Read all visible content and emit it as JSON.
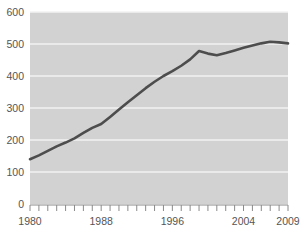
{
  "chart_data": {
    "type": "line",
    "title": "",
    "subtitle": "",
    "xlabel": "",
    "ylabel": "",
    "xlim": [
      1980,
      2009
    ],
    "ylim": [
      0,
      600
    ],
    "grid": true,
    "legend": false,
    "legend_position": "none",
    "background_color": "#d2d2d2",
    "gridline_color": "#f2f2f2",
    "line_color": "#4d4d4d",
    "label_color": "#555555",
    "y_ticks": [
      0,
      100,
      200,
      300,
      400,
      500,
      600
    ],
    "y_tick_labels": [
      "0",
      "100",
      "200",
      "300",
      "400",
      "500",
      "600"
    ],
    "x_ticks": [
      1980,
      1981,
      1982,
      1983,
      1984,
      1985,
      1986,
      1987,
      1988,
      1989,
      1990,
      1991,
      1992,
      1993,
      1994,
      1995,
      1996,
      1997,
      1998,
      1999,
      2000,
      2001,
      2002,
      2003,
      2004,
      2005,
      2006,
      2007,
      2008,
      2009
    ],
    "x_tick_labels": [
      "1980",
      "1988",
      "1996",
      "2004",
      "2009"
    ],
    "x_tick_label_values": [
      1980,
      1988,
      1996,
      2004,
      2009
    ],
    "x": [
      1980,
      1981,
      1982,
      1983,
      1984,
      1985,
      1986,
      1987,
      1988,
      1989,
      1990,
      1991,
      1992,
      1993,
      1994,
      1995,
      1996,
      1997,
      1998,
      1999,
      2000,
      2001,
      2002,
      2003,
      2004,
      2005,
      2006,
      2007,
      2008,
      2009
    ],
    "values": [
      140,
      152,
      166,
      180,
      192,
      205,
      222,
      238,
      250,
      272,
      295,
      318,
      340,
      362,
      382,
      400,
      415,
      432,
      452,
      478,
      470,
      465,
      472,
      480,
      488,
      495,
      502,
      507,
      505,
      502
    ],
    "series": [
      {
        "name": "series-1",
        "color": "#4d4d4d",
        "values": [
          140,
          152,
          166,
          180,
          192,
          205,
          222,
          238,
          250,
          272,
          295,
          318,
          340,
          362,
          382,
          400,
          415,
          432,
          452,
          478,
          470,
          465,
          472,
          480,
          488,
          495,
          502,
          507,
          505,
          502
        ]
      }
    ],
    "annotations": []
  }
}
